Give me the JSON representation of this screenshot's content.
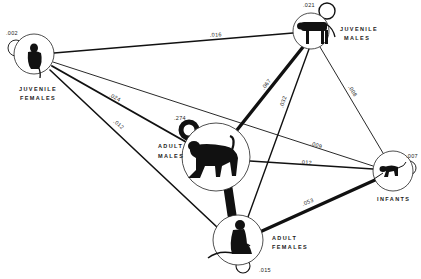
{
  "diagram": {
    "type": "sociogram",
    "nodes": [
      {
        "id": "jf",
        "label_line1": "JUVENILE",
        "label_line2": "FEMALES",
        "self_value": ".002",
        "icon": "sitting-juvenile-monkey-icon"
      },
      {
        "id": "jm",
        "label_line1": "JUVENILE",
        "label_line2": "MALES",
        "self_value": ".021",
        "icon": "standing-juvenile-monkey-icon"
      },
      {
        "id": "am",
        "label_line1": "ADULT",
        "label_line2": "MALES",
        "self_value": ".274",
        "icon": "walking-adult-male-monkey-icon"
      },
      {
        "id": "inf",
        "label_line1": "INFANTS",
        "label_line2": "",
        "self_value": ".007",
        "icon": "crawling-infant-monkey-icon"
      },
      {
        "id": "af",
        "label_line1": "ADULT",
        "label_line2": "FEMALES",
        "self_value": ".015",
        "icon": "sitting-adult-female-monkey-icon"
      }
    ],
    "edges": [
      {
        "from": "jf",
        "to": "jm",
        "value": ".016"
      },
      {
        "from": "jf",
        "to": "am",
        "value": ".024"
      },
      {
        "from": "jf",
        "to": "af",
        "value": ".012"
      },
      {
        "from": "jf",
        "to": "inf",
        "value": ".009"
      },
      {
        "from": "jm",
        "to": "am",
        "value": ".067"
      },
      {
        "from": "jm",
        "to": "af",
        "value": ".032"
      },
      {
        "from": "jm",
        "to": "inf",
        "value": ".008"
      },
      {
        "from": "am",
        "to": "inf",
        "value": ".012"
      },
      {
        "from": "am",
        "to": "af",
        "value": ".488"
      },
      {
        "from": "af",
        "to": "inf",
        "value": ".053"
      }
    ]
  }
}
